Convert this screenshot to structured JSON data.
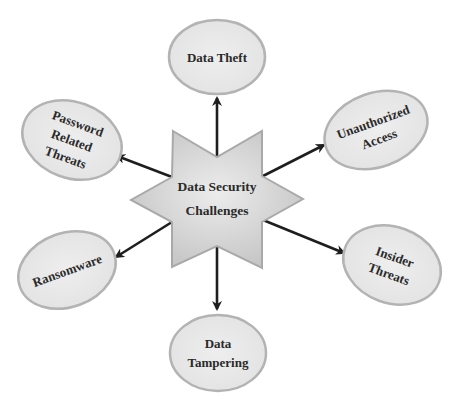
{
  "diagram": {
    "type": "hub-and-spoke",
    "center": {
      "lines": [
        "Data Security",
        "Challenges"
      ],
      "shape": "six-pointed-star"
    },
    "nodes": [
      {
        "id": "data-theft",
        "lines": [
          "Data Theft"
        ],
        "direction": "up"
      },
      {
        "id": "unauthorized-access",
        "lines": [
          "Unauthorized",
          "Access"
        ],
        "direction": "upper-right"
      },
      {
        "id": "insider-threats",
        "lines": [
          "Insider",
          "Threats"
        ],
        "direction": "lower-right"
      },
      {
        "id": "data-tampering",
        "lines": [
          "Data",
          "Tampering"
        ],
        "direction": "down"
      },
      {
        "id": "ransomware",
        "lines": [
          "Ransomware"
        ],
        "direction": "lower-left"
      },
      {
        "id": "password-related-threats",
        "lines": [
          "Password",
          "Related",
          "Threats"
        ],
        "direction": "upper-left"
      }
    ],
    "colors": {
      "ellipse_fill": "#e9e9e9",
      "ellipse_stroke": "#b3b3b3",
      "star_fill_light": "#e6e6e6",
      "star_fill_dark": "#c6c6c6",
      "star_stroke": "#a9a9a9",
      "arrow": "#1e1e1e",
      "text": "#2a2a2a"
    }
  }
}
